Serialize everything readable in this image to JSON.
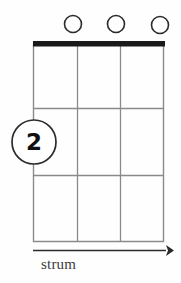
{
  "diagram": {
    "type": "guitar-chord-diagram",
    "orientation": "vertical",
    "strings": 4,
    "frets": 3,
    "nut": {
      "visible": true,
      "color": "#1a1a1a",
      "thickness": 5
    },
    "grid": {
      "line_color": "#8a8a8a",
      "string_x": [
        33,
        77,
        120,
        164
      ],
      "fret_y": [
        46,
        108,
        175,
        242
      ]
    },
    "open_strings": {
      "marker": "open-circle",
      "count": 3,
      "positions": [
        {
          "string": 2,
          "cx": 73,
          "cy": 24,
          "r": 8.5
        },
        {
          "string": 3,
          "cx": 116,
          "cy": 24,
          "r": 8.5
        },
        {
          "string": 4,
          "cx": 160,
          "cy": 25,
          "r": 8.5
        }
      ],
      "stroke_color": "#2b2b2b"
    },
    "finger_markers": [
      {
        "label": "2",
        "string": 1,
        "fret": 2,
        "cx": 34,
        "cy": 142,
        "r": 22,
        "stroke_color": "#2b2b2b",
        "fill_color": "#ffffff",
        "text_color": "#111111"
      }
    ],
    "strum": {
      "label": "strum",
      "direction": "right",
      "arrow": {
        "x1": 33,
        "x2": 172,
        "y": 250,
        "color": "#2b2b2b"
      }
    }
  }
}
